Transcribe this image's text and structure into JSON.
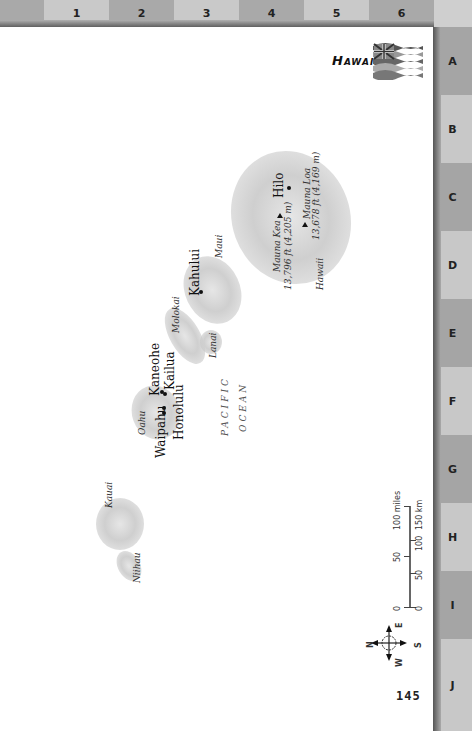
{
  "page": {
    "title": "Hawaii",
    "page_number": "145"
  },
  "grid": {
    "columns": [
      "",
      "1",
      "2",
      "3",
      "4",
      "5",
      "6"
    ],
    "rows": [
      "A",
      "B",
      "C",
      "D",
      "E",
      "F",
      "G",
      "H",
      "I",
      "J"
    ]
  },
  "map": {
    "ocean_label_line1": "PACIFIC",
    "ocean_label_line2": "OCEAN",
    "islands": {
      "hawaii": "Hawaii",
      "maui": "Maui",
      "molokai": "Molokai",
      "lanai": "Lanai",
      "oahu": "Oahu",
      "kauai": "Kauai",
      "niihau": "Niihau"
    },
    "cities": {
      "hilo": "Hilo",
      "kahului": "Kahului",
      "kaneohe": "Kaneohe",
      "kailua": "Kailua",
      "honolulu": "Honolulu",
      "waipahu": "Waipahu"
    },
    "peaks": {
      "mauna_kea_name": "Mauna Kea",
      "mauna_kea_elev": "13,796 ft (4,205 m)",
      "mauna_loa_name": "Mauna Loa",
      "mauna_loa_elev": "13,678 ft (4,169 m)"
    }
  },
  "scale": {
    "miles_ticks": [
      "0",
      "50",
      "100 miles"
    ],
    "km_ticks": [
      "0",
      "50",
      "100",
      "150 km"
    ]
  },
  "compass": {
    "n": "N",
    "e": "E",
    "s": "S",
    "w": "W"
  },
  "colors": {
    "band_dark": "#a9a9a9",
    "band_light": "#c9c9c9",
    "land": "#d0d0d0"
  }
}
